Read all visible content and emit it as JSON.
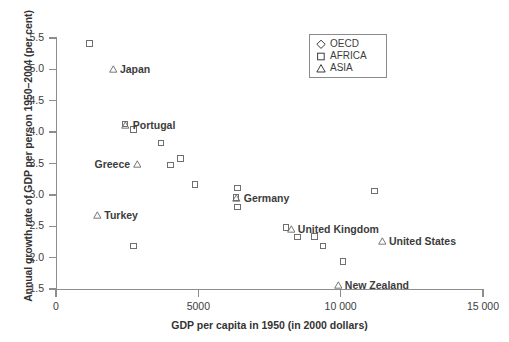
{
  "chart_data": {
    "type": "scatter",
    "title": "",
    "xlabel": "GDP per capita in 1950 (in 2000 dollars)",
    "ylabel": "Annual growth rate of GDP per person 1950–2004 (per cent)",
    "xlim": [
      0,
      15000
    ],
    "ylim": [
      1.5,
      5.5
    ],
    "xticks": [
      0,
      5000,
      10000,
      15000
    ],
    "xtick_labels": [
      "0",
      "5000",
      "10 000",
      "15 000"
    ],
    "yticks": [
      1.5,
      2.0,
      2.5,
      3.0,
      3.5,
      4.0,
      4.5,
      5.0,
      5.5
    ],
    "ytick_labels": [
      "1.5",
      "2.0",
      "2.5",
      "3.0",
      "3.5",
      "4.0",
      "4.5",
      "5.0",
      "5.5"
    ],
    "grid": false,
    "legend_position": "top-right",
    "legend": [
      {
        "name": "OECD",
        "marker": "diamond"
      },
      {
        "name": "AFRICA",
        "marker": "square"
      },
      {
        "name": "ASIA",
        "marker": "triangle"
      }
    ],
    "series": [
      {
        "name": "OECD",
        "marker": "diamond",
        "points": []
      },
      {
        "name": "AFRICA",
        "marker": "square",
        "points": [
          {
            "x": 1200,
            "y": 5.4,
            "label": ""
          },
          {
            "x": 2450,
            "y": 4.12,
            "label": ""
          },
          {
            "x": 2750,
            "y": 4.03,
            "label": ""
          },
          {
            "x": 3700,
            "y": 3.82,
            "label": ""
          },
          {
            "x": 4400,
            "y": 3.57,
            "label": ""
          },
          {
            "x": 4050,
            "y": 3.47,
            "label": ""
          },
          {
            "x": 4900,
            "y": 3.16,
            "label": ""
          },
          {
            "x": 6350,
            "y": 2.95,
            "label": ""
          },
          {
            "x": 6400,
            "y": 3.1,
            "label": ""
          },
          {
            "x": 6400,
            "y": 2.8,
            "label": ""
          },
          {
            "x": 2750,
            "y": 2.18,
            "label": ""
          },
          {
            "x": 11200,
            "y": 3.05,
            "label": ""
          },
          {
            "x": 8100,
            "y": 2.47,
            "label": ""
          },
          {
            "x": 8500,
            "y": 2.32,
            "label": ""
          },
          {
            "x": 9100,
            "y": 2.33,
            "label": ""
          },
          {
            "x": 9400,
            "y": 2.18,
            "label": ""
          },
          {
            "x": 10100,
            "y": 1.93,
            "label": ""
          }
        ]
      },
      {
        "name": "ASIA",
        "marker": "triangle",
        "points": [
          {
            "x": 2000,
            "y": 5.0,
            "label": "Japan",
            "label_side": "right"
          },
          {
            "x": 2450,
            "y": 4.12,
            "label": "Portugal",
            "label_side": "right"
          },
          {
            "x": 2850,
            "y": 3.49,
            "label": "Greece",
            "label_side": "left"
          },
          {
            "x": 1450,
            "y": 2.68,
            "label": "Turkey",
            "label_side": "right"
          },
          {
            "x": 6350,
            "y": 2.95,
            "label": "Germany",
            "label_side": "right"
          },
          {
            "x": 8250,
            "y": 2.45,
            "label": "United Kingdom",
            "label_side": "right"
          },
          {
            "x": 11450,
            "y": 2.26,
            "label": "United States",
            "label_side": "right"
          },
          {
            "x": 9900,
            "y": 1.57,
            "label": "New Zealand",
            "label_side": "right"
          }
        ]
      }
    ]
  }
}
